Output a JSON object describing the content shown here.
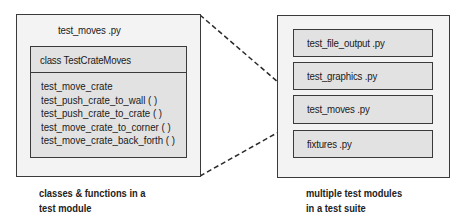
{
  "left_panel": {
    "title": "test_moves .py",
    "class_box": {
      "header": "class TestCrateMoves",
      "methods": [
        "test_move_crate",
        "test_push_crate_to_wall ( )",
        "test_push_crate_to_crate ( )",
        "test_move_crate_to_corner ( )",
        "test_move_crate_back_forth ( )"
      ]
    },
    "caption_line1": "classes & functions in a",
    "caption_line2": "test module"
  },
  "right_panel": {
    "modules": [
      {
        "label": "test_file_output .py"
      },
      {
        "label": "test_graphics .py"
      },
      {
        "label": "test_moves .py"
      },
      {
        "label": "fixtures .py"
      }
    ],
    "caption_line1": "multiple test modules",
    "caption_line2": "in a test suite"
  },
  "colors": {
    "outer_fill": "#f3f3f3",
    "inner_fill": "#e2e2e2",
    "border": "#3a3a3a"
  }
}
